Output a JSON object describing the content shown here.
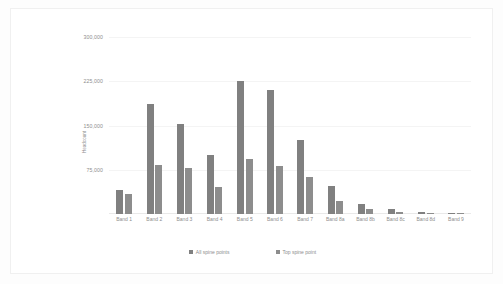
{
  "chart_data": {
    "type": "bar",
    "title": "",
    "xlabel": "",
    "ylabel": "Headcount",
    "ylim": [
      0,
      300000
    ],
    "yticks": [
      300000,
      225000,
      150000,
      75000
    ],
    "ytick_labels": [
      "300,000",
      "225,000",
      "150,000",
      "75,000"
    ],
    "grid": true,
    "legend_position": "bottom",
    "categories": [
      "Band 1",
      "Band 2",
      "Band 3",
      "Band 4",
      "Band 5",
      "Band 6",
      "Band 7",
      "Band 8a",
      "Band 8b",
      "Band 8c",
      "Band 8d",
      "Band 9"
    ],
    "series": [
      {
        "name": "All spine points",
        "color": "#808080",
        "values": [
          40000,
          186000,
          152000,
          100000,
          226000,
          210000,
          126000,
          48000,
          17000,
          9000,
          4000,
          1500
        ]
      },
      {
        "name": "Top spine point",
        "color": "#8d8d8d",
        "values": [
          34000,
          83000,
          78000,
          46000,
          93000,
          82000,
          62000,
          22000,
          9000,
          4000,
          2000,
          800
        ]
      }
    ]
  }
}
